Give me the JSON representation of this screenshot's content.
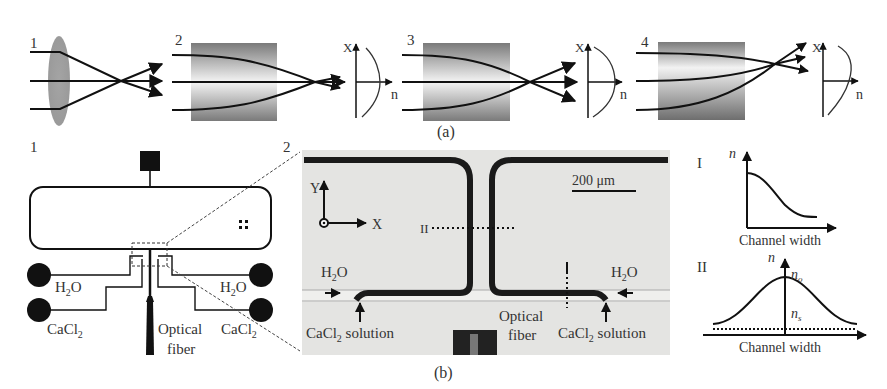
{
  "panel_a": {
    "caption": "(a)",
    "sub_labels": [
      "1",
      "2",
      "3",
      "4"
    ],
    "axis_x_label": "X",
    "axis_n_label": "n"
  },
  "panel_b": {
    "caption": "(b)",
    "schematic": {
      "label": "1",
      "h2o_left": "H",
      "h2o_sub": "2",
      "h2o_o": "O",
      "cacl_left": "CaCl",
      "cacl_sub": "2",
      "fiber_line1": "Optical",
      "fiber_line2": "fiber"
    },
    "micrograph": {
      "label": "2",
      "scale_bar": "200 μm",
      "axis_y": "Y",
      "axis_x": "X",
      "section_marker": "II",
      "h2o_left": "H",
      "h2o_right": "H",
      "h2o_sub": "2",
      "h2o_o": "O",
      "cacl_left": "CaCl",
      "cacl_right": "CaCl",
      "cacl_sub": "2",
      "solution": "solution",
      "fiber_line1": "Optical",
      "fiber_line2": "fiber"
    },
    "profiles": {
      "profile_I_label": "I",
      "profile_II_label": "II",
      "n_label": "n",
      "n0_label": "n",
      "n0_sub": "o",
      "ns_label": "n",
      "ns_sub": "s",
      "xlabel": "Channel width"
    }
  },
  "colors": {
    "line": "#111111",
    "text": "#333333",
    "gradient_dark": "#7a7a7a",
    "gradient_light": "#f2f2f2",
    "lens": "#9a9a9a",
    "micrograph_bg": "#e6e6e4",
    "channel_wall": "#1a1a1a"
  }
}
